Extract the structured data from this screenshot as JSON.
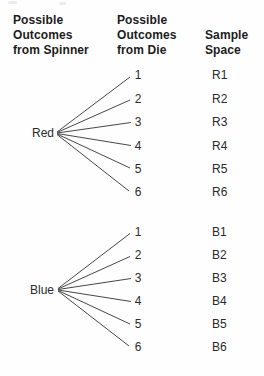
{
  "headers": {
    "spinner": "Possible\nOutcomes\nfrom Spinner",
    "die": "Possible\nOutcomes\nfrom Die",
    "sample": "Sample\nSpace"
  },
  "tree": {
    "red": {
      "label": "Red",
      "rows": [
        {
          "die": "1",
          "sample": "R1"
        },
        {
          "die": "2",
          "sample": "R2"
        },
        {
          "die": "3",
          "sample": "R3"
        },
        {
          "die": "4",
          "sample": "R4"
        },
        {
          "die": "5",
          "sample": "R5"
        },
        {
          "die": "6",
          "sample": "R6"
        }
      ]
    },
    "blue": {
      "label": "Blue",
      "rows": [
        {
          "die": "1",
          "sample": "B1"
        },
        {
          "die": "2",
          "sample": "B2"
        },
        {
          "die": "3",
          "sample": "B3"
        },
        {
          "die": "4",
          "sample": "B4"
        },
        {
          "die": "5",
          "sample": "B5"
        },
        {
          "die": "6",
          "sample": "B6"
        }
      ]
    }
  },
  "colors": {
    "text": "#1e1e1e",
    "line": "#474747",
    "background": "#ffffff"
  }
}
